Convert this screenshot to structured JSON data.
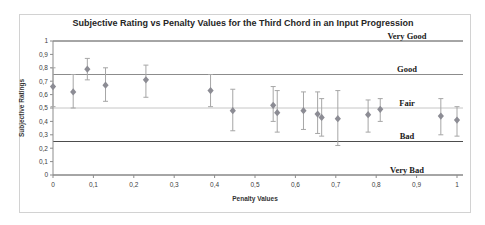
{
  "chart_data": {
    "type": "scatter",
    "title": "Subjective Rating vs Penalty Values for the Third Chord in an Input Progression",
    "xlabel": "Penalty Values",
    "ylabel": "Subjective Ratings",
    "xlim": [
      0,
      1
    ],
    "ylim": [
      0,
      1
    ],
    "grid": false,
    "legend": "none",
    "x_ticks": [
      0,
      0.1,
      0.2,
      0.3,
      0.4,
      0.5,
      0.6,
      0.7,
      0.8,
      0.9,
      1
    ],
    "x_tick_labels": [
      "0",
      "0,1",
      "0,2",
      "0,3",
      "0,4",
      "0,5",
      "0,6",
      "0,7",
      "0,8",
      "0,9",
      "1"
    ],
    "y_ticks": [
      0,
      0.1,
      0.2,
      0.3,
      0.4,
      0.5,
      0.6,
      0.7,
      0.8,
      0.9,
      1
    ],
    "y_tick_labels": [
      "0",
      "0,1",
      "0,2",
      "0,3",
      "0,4",
      "0,5",
      "0,6",
      "0,7",
      "0,8",
      "0,9",
      "1"
    ],
    "reference_lines": [
      {
        "value": 1.0,
        "label": "Very Good",
        "color": "#4d4d4d"
      },
      {
        "value": 0.75,
        "label": "Good",
        "color": "#8c8c8c"
      },
      {
        "value": 0.5,
        "label": "Fair",
        "color": "#c6c6c6"
      },
      {
        "value": 0.25,
        "label": "Bad",
        "color": "#4d4d4d"
      },
      {
        "value": 0.0,
        "label": "Very Bad",
        "color": "#4d4d4d"
      }
    ],
    "series": [
      {
        "marker": "diamond",
        "marker_color": "#8c8c94",
        "error_bar_color": "#a6a6a6",
        "points": [
          {
            "x": 0.0,
            "y": 0.66,
            "err_low": 0.51,
            "err_high": 0.8
          },
          {
            "x": 0.05,
            "y": 0.62,
            "err_low": 0.5,
            "err_high": 0.75
          },
          {
            "x": 0.085,
            "y": 0.79,
            "err_low": 0.71,
            "err_high": 0.87
          },
          {
            "x": 0.13,
            "y": 0.67,
            "err_low": 0.55,
            "err_high": 0.8
          },
          {
            "x": 0.23,
            "y": 0.71,
            "err_low": 0.58,
            "err_high": 0.82
          },
          {
            "x": 0.39,
            "y": 0.63,
            "err_low": 0.51,
            "err_high": 0.75
          },
          {
            "x": 0.445,
            "y": 0.48,
            "err_low": 0.33,
            "err_high": 0.64
          },
          {
            "x": 0.545,
            "y": 0.52,
            "err_low": 0.4,
            "err_high": 0.66
          },
          {
            "x": 0.555,
            "y": 0.465,
            "err_low": 0.32,
            "err_high": 0.63
          },
          {
            "x": 0.62,
            "y": 0.48,
            "err_low": 0.34,
            "err_high": 0.62
          },
          {
            "x": 0.655,
            "y": 0.455,
            "err_low": 0.31,
            "err_high": 0.62
          },
          {
            "x": 0.665,
            "y": 0.43,
            "err_low": 0.29,
            "err_high": 0.57
          },
          {
            "x": 0.705,
            "y": 0.42,
            "err_low": 0.22,
            "err_high": 0.63
          },
          {
            "x": 0.78,
            "y": 0.45,
            "err_low": 0.32,
            "err_high": 0.56
          },
          {
            "x": 0.81,
            "y": 0.49,
            "err_low": 0.4,
            "err_high": 0.57
          },
          {
            "x": 0.96,
            "y": 0.44,
            "err_low": 0.3,
            "err_high": 0.57
          },
          {
            "x": 1.0,
            "y": 0.41,
            "err_low": 0.29,
            "err_high": 0.51
          }
        ]
      }
    ],
    "axis_color": "#8c8c8c",
    "tick_color": "#8c8c8c"
  }
}
